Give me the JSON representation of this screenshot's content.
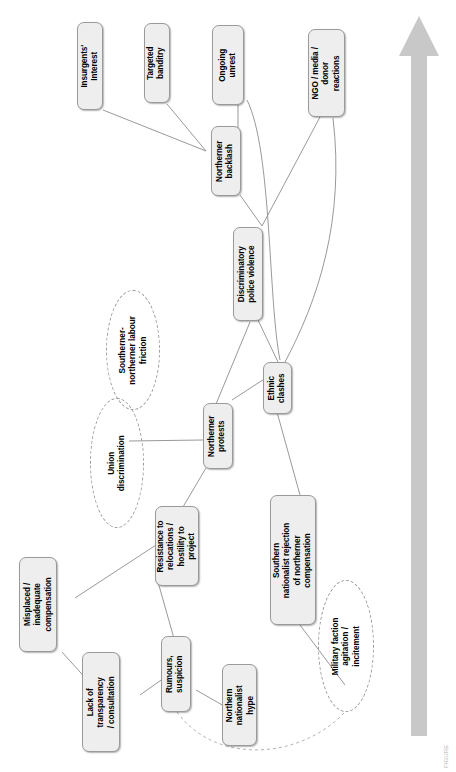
{
  "figure": {
    "type": "causal-loop-diagram",
    "orientation": "rotated-90-ccw",
    "caption": "FIGURE",
    "background_color": "#ffffff",
    "node_fill": "#eeeeee",
    "node_border": "#9a9a9a",
    "edge_color": "#8d8d8d",
    "arrow_color": "#c8c8c8"
  },
  "timeline_arrow": {
    "name": "escalation-arrow",
    "direction": "up",
    "color": "#c8c8c8"
  },
  "nodes": [
    {
      "id": "insurgents-interest",
      "label": "Insurgents'\nInterest"
    },
    {
      "id": "targeted-banditry",
      "label": "Targeted\nbanditry"
    },
    {
      "id": "ongoing-unrest",
      "label": "Ongoing\nunrest"
    },
    {
      "id": "ngo-media-donor-reactions",
      "label": "NGO / media /\ndonor\nreactions"
    },
    {
      "id": "northerner-backlash",
      "label": "Northerner\nbacklash"
    },
    {
      "id": "discriminatory-police-violence",
      "label": "Discriminatory\npolice violence"
    },
    {
      "id": "northerner-protests",
      "label": "Northerner\nprotests"
    },
    {
      "id": "ethnic-clashes",
      "label": "Ethnic\nclashes"
    },
    {
      "id": "resistance-to-relocations",
      "label": "Resistance to\nrelocations /\nhostility to\nproject"
    },
    {
      "id": "southern-nationalist-rejection",
      "label": "Southern\nnationalist rejection\nof northerner\ncompensation"
    },
    {
      "id": "misplaced-inadequate-compensation",
      "label": "Misplaced /\ninadequate\ncompensation"
    },
    {
      "id": "lack-of-transparency",
      "label": "Lack of\ntransparency\n/ consultation"
    },
    {
      "id": "rumours-suspicion",
      "label": "Rumours,\nsuspicion"
    },
    {
      "id": "northern-nationalist-hype",
      "label": "Northern\nnationalist\nhype"
    }
  ],
  "ellipses": [
    {
      "id": "southerner-northerner-labour-friction",
      "label": "Southerner-\nnortherner labour\nfriction"
    },
    {
      "id": "union-discrimination",
      "label": "Union\ndiscrimination"
    },
    {
      "id": "military-faction-agitation",
      "label": "Military faction\nagitation /\nincitement"
    }
  ],
  "edges": [
    {
      "from": "insurgents-interest",
      "to": "northerner-backlash",
      "style": "solid"
    },
    {
      "from": "targeted-banditry",
      "to": "northerner-backlash",
      "style": "solid"
    },
    {
      "from": "ongoing-unrest",
      "to": "northerner-backlash",
      "style": "solid"
    },
    {
      "from": "ongoing-unrest",
      "to": "ethnic-clashes",
      "style": "curved"
    },
    {
      "from": "northerner-backlash",
      "to": "discriminatory-police-violence",
      "style": "solid"
    },
    {
      "from": "ngo-media-donor-reactions",
      "to": "discriminatory-police-violence",
      "style": "solid"
    },
    {
      "from": "ngo-media-donor-reactions",
      "to": "ethnic-clashes",
      "style": "curved"
    },
    {
      "from": "discriminatory-police-violence",
      "to": "ethnic-clashes",
      "style": "solid"
    },
    {
      "from": "discriminatory-police-violence",
      "to": "northerner-protests",
      "style": "solid"
    },
    {
      "from": "northerner-protests",
      "to": "ethnic-clashes",
      "style": "solid"
    },
    {
      "from": "northerner-protests",
      "to": "union-discrimination",
      "style": "solid"
    },
    {
      "from": "northerner-protests",
      "to": "resistance-to-relocations",
      "style": "solid"
    },
    {
      "from": "ethnic-clashes",
      "to": "southern-nationalist-rejection",
      "style": "solid"
    },
    {
      "from": "southern-nationalist-rejection",
      "to": "military-faction-agitation",
      "style": "solid"
    },
    {
      "from": "resistance-to-relocations",
      "to": "misplaced-inadequate-compensation",
      "style": "solid"
    },
    {
      "from": "resistance-to-relocations",
      "to": "rumours-suspicion",
      "style": "solid"
    },
    {
      "from": "misplaced-inadequate-compensation",
      "to": "lack-of-transparency",
      "style": "solid"
    },
    {
      "from": "lack-of-transparency",
      "to": "rumours-suspicion",
      "style": "solid"
    },
    {
      "from": "rumours-suspicion",
      "to": "northern-nationalist-hype",
      "style": "solid"
    },
    {
      "from": "rumours-suspicion",
      "to": "military-faction-agitation",
      "style": "dashed"
    }
  ]
}
